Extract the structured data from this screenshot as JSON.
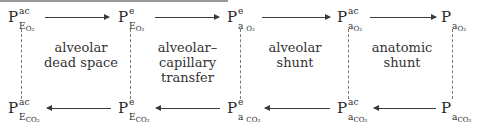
{
  "diagram": {
    "title": "",
    "top_row": [
      {
        "base": "P",
        "sup": "ac",
        "sub": "E",
        "gas": "O₂"
      },
      {
        "base": "P",
        "sup": "e",
        "sub": "E",
        "gas": "O₂"
      },
      {
        "base": "P",
        "sup": "e",
        "sub": "a ",
        "gas": "O₂"
      },
      {
        "base": "P",
        "sup": "ac",
        "sub": "a",
        "gas": "O₂"
      },
      {
        "base": "P",
        "sup": "",
        "sub": "a",
        "gas": "O₂"
      }
    ],
    "bottom_row": [
      {
        "base": "P",
        "sup": "ac",
        "sub": "E",
        "gas": "CO₂"
      },
      {
        "base": "P",
        "sup": "e",
        "sub": "E",
        "gas": "CO₂"
      },
      {
        "base": "P",
        "sup": "e",
        "sub": "a ",
        "gas": "CO₂"
      },
      {
        "base": "P",
        "sup": "ac",
        "sub": "a",
        "gas": "CO₂"
      },
      {
        "base": "P",
        "sup": "",
        "sub": "a",
        "gas": "CO₂"
      }
    ],
    "compartments": [
      {
        "line1": "alveolar",
        "line2": "dead space",
        "line3": ""
      },
      {
        "line1": "alveolar–",
        "line2": "capillary",
        "line3": "transfer"
      },
      {
        "line1": "alveolar",
        "line2": "shunt",
        "line3": ""
      },
      {
        "line1": "anatomic",
        "line2": "shunt",
        "line3": ""
      }
    ],
    "top_arrow_direction": "right",
    "bottom_arrow_direction": "left"
  }
}
